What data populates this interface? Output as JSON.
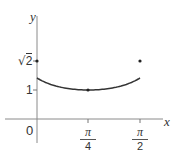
{
  "chart_data": {
    "type": "line",
    "title": "",
    "xlabel": "x",
    "ylabel": "y",
    "function": "y = sec(x - π/4)",
    "x": [
      0,
      0.3927,
      0.7854,
      1.1781,
      1.5708
    ],
    "values": [
      1.4142,
      1.0824,
      1.0,
      1.0824,
      1.4142
    ],
    "points_marked": [
      {
        "x_label": "0",
        "y_label": "√2"
      },
      {
        "x_label": "π/4",
        "y_label": "1"
      },
      {
        "x_label": "π/2",
        "y_label": "√2"
      }
    ],
    "xticks": [
      "0",
      "π/4",
      "π/2"
    ],
    "yticks": [
      "1",
      "√2"
    ],
    "xlim": [
      0,
      1.5708
    ],
    "ylim": [
      0,
      1.4142
    ],
    "grid": false,
    "legend": "none"
  },
  "labels": {
    "x_axis": "x",
    "y_axis": "y",
    "origin": "0",
    "ytick_sqrt2": "√2",
    "ytick_sqrt2_radicand": "2",
    "ytick_1": "1",
    "xtick_pi4_num": "π",
    "xtick_pi4_den": "4",
    "xtick_pi2_num": "π",
    "xtick_pi2_den": "2"
  },
  "colors": {
    "axis": "#8a8a8a",
    "curve": "#333333",
    "text": "#333333"
  }
}
